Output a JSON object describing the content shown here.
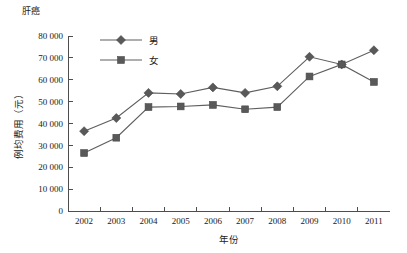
{
  "chart_data": {
    "type": "line",
    "title": "肝癌",
    "xlabel": "年份",
    "ylabel": "例均费用（元）",
    "categories": [
      "2002",
      "2003",
      "2004",
      "2005",
      "2006",
      "2007",
      "2008",
      "2009",
      "2010",
      "2011"
    ],
    "series": [
      {
        "name": "男",
        "marker": "diamond",
        "color": "#595959",
        "values": [
          36500,
          42500,
          54000,
          53500,
          56500,
          54000,
          57000,
          70500,
          67000,
          73500
        ]
      },
      {
        "name": "女",
        "marker": "square",
        "color": "#595959",
        "values": [
          26500,
          33500,
          47500,
          47800,
          48500,
          46500,
          47500,
          61500,
          67000,
          59000
        ]
      }
    ],
    "ylim": [
      0,
      80000
    ],
    "ytick_labels": [
      "0",
      "10 000",
      "20 000",
      "30 000",
      "40 000",
      "50 000",
      "60 000",
      "70 000",
      "80 000"
    ],
    "ytick_values": [
      0,
      10000,
      20000,
      30000,
      40000,
      50000,
      60000,
      70000,
      80000
    ],
    "grid": false,
    "legend_position": "top-left-inside"
  }
}
